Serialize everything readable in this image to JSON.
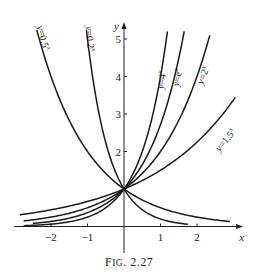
{
  "chart_data": {
    "type": "line",
    "title": "",
    "caption": "FIG. 2.27",
    "xlabel": "x",
    "ylabel": "y",
    "xlim": [
      -2.9,
      3.1
    ],
    "ylim": [
      -0.6,
      5.4
    ],
    "grid": false,
    "x_ticks": [
      -2,
      -1,
      1,
      2
    ],
    "x_tick_labels": [
      "−2",
      "−1",
      "1",
      "2"
    ],
    "y_ticks": [
      2,
      3,
      4,
      5
    ],
    "y_tick_labels": [
      "2",
      "3",
      "4",
      "5"
    ],
    "legend": "none (curves labeled inline)",
    "series": [
      {
        "name": "y=0.5^x",
        "label": "y=0.5",
        "sup": "x",
        "base": 0.5,
        "x_range": [
          -2.39,
          2.9
        ],
        "label_pos": [
          -2.3,
          5.0
        ],
        "label_rot": 75
      },
      {
        "name": "y=0.2^x",
        "label": "y=0.2",
        "sup": "x",
        "base": 0.2,
        "x_range": [
          -1.03,
          1.75
        ],
        "label_pos": [
          -1.02,
          5.0
        ],
        "label_rot": 85
      },
      {
        "name": "y=4^x",
        "label": "y=4",
        "sup": "x",
        "base": 4.0,
        "x_range": [
          -2.75,
          1.19
        ],
        "label_pos": [
          1.12,
          3.9
        ],
        "label_rot": -82
      },
      {
        "name": "y=e^x",
        "label": "y=e",
        "sup": "x",
        "base": 2.718281828,
        "x_range": [
          -2.5,
          1.65
        ],
        "label_pos": [
          1.55,
          3.95
        ],
        "label_rot": -78
      },
      {
        "name": "y=2^x",
        "label": "y=2",
        "sup": "x",
        "base": 2.0,
        "x_range": [
          -2.75,
          2.35
        ],
        "label_pos": [
          2.25,
          4.0
        ],
        "label_rot": -68
      },
      {
        "name": "y=1.5^x",
        "label": "y=1.5",
        "sup": "x",
        "base": 1.5,
        "x_range": [
          -2.85,
          3.05
        ],
        "label_pos": [
          2.85,
          2.25
        ],
        "label_rot": -50
      }
    ],
    "intersection_point": [
      0,
      1
    ]
  },
  "layout": {
    "origin_px": [
      124,
      226.5
    ],
    "px_per_unit_x": 36.5,
    "px_per_unit_y": 37.5
  }
}
